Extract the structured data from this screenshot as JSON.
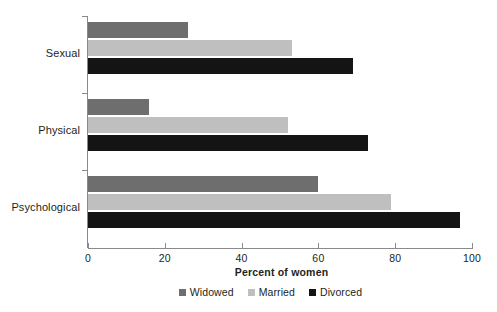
{
  "chart_data": {
    "type": "bar",
    "orientation": "horizontal",
    "title": "",
    "xlabel": "Percent of women",
    "ylabel": "",
    "xlim": [
      0,
      100
    ],
    "xticks": [
      0,
      20,
      40,
      60,
      80,
      100
    ],
    "xtick_labels": [
      "0",
      "20",
      "40",
      "60",
      "80",
      "100"
    ],
    "grid": false,
    "legend_position": "bottom",
    "categories": [
      "Sexual",
      "Physical",
      "Psychological"
    ],
    "series": [
      {
        "name": "Widowed",
        "color": "#6e6e6e",
        "values": [
          26,
          16,
          60
        ]
      },
      {
        "name": "Married",
        "color": "#bfbfbf",
        "values": [
          53,
          52,
          79
        ]
      },
      {
        "name": "Divorced",
        "color": "#141414",
        "values": [
          69,
          73,
          97
        ]
      }
    ]
  },
  "axis": {
    "x_title": "Percent of women"
  },
  "legend": {
    "items": [
      {
        "label": "Widowed",
        "color": "#6e6e6e"
      },
      {
        "label": "Married",
        "color": "#bfbfbf"
      },
      {
        "label": "Divorced",
        "color": "#141414"
      }
    ]
  },
  "colors": {
    "widowed": "#6e6e6e",
    "married": "#bfbfbf",
    "divorced": "#141414",
    "axis": "#8a8a8a",
    "text": "#231f20",
    "background": "#ffffff"
  }
}
